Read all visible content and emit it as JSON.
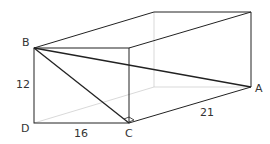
{
  "diagram": {
    "type": "rectangular prism (cuboid)",
    "labels": {
      "B": "B",
      "A": "A",
      "C": "C",
      "D": "D"
    },
    "dimensions": {
      "height": "12",
      "width": "16",
      "length": "21"
    },
    "colors": {
      "line": "#222222",
      "hidden": "#bbbbbb"
    }
  }
}
